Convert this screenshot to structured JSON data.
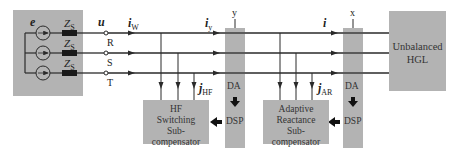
{
  "diagram": {
    "source": {
      "emf_label": "e",
      "impedance_labels": [
        "Z",
        "Z",
        "Z"
      ],
      "impedance_subscript": "S",
      "phases": [
        "R",
        "S",
        "T"
      ]
    },
    "wire_labels": {
      "u": "u",
      "i_w": "i",
      "i_w_sub": "W",
      "i_y": "i",
      "i_y_sub": "y",
      "i": "i",
      "j_hf": "j",
      "j_hf_sub": "HF",
      "j_ar": "j",
      "j_ar_sub": "AR"
    },
    "measurement_points": {
      "y": {
        "label": "y",
        "top": "DA",
        "bottom": "DSP"
      },
      "x": {
        "label": "x",
        "top": "DA",
        "bottom": "DSP"
      }
    },
    "blocks": {
      "hf": [
        "HF",
        "Switching",
        "Sub-compensator"
      ],
      "ar": [
        "Adaptive",
        "Reactance",
        "Sub-compensator"
      ],
      "load": [
        "Unbalanced",
        "HGL"
      ]
    },
    "colors": {
      "box_fill": "#b3b3b3",
      "line": "#2a2a2a",
      "background": "#ffffff"
    }
  }
}
